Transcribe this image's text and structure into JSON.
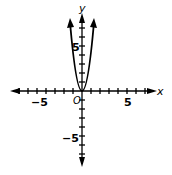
{
  "chart_data": {
    "type": "line",
    "title": "",
    "xlabel": "x",
    "ylabel": "y",
    "origin_label": "O",
    "x_tick_labels": [
      "-5",
      "5"
    ],
    "y_tick_labels": [
      "5",
      "-5"
    ],
    "xlim": [
      -9,
      8
    ],
    "ylim": [
      -9,
      8
    ],
    "grid": false,
    "series": [
      {
        "name": "parabola",
        "equation": "y = 4x^2",
        "x": [
          -1.35,
          -1,
          -0.5,
          0,
          0.5,
          1,
          1.35
        ],
        "y": [
          7.3,
          4,
          1,
          0,
          1,
          4,
          7.3
        ]
      }
    ]
  },
  "labels": {
    "x": "x",
    "y": "y",
    "o": "O",
    "xneg": "−5",
    "xpos": "5",
    "ypos": "5",
    "yneg": "−5"
  }
}
